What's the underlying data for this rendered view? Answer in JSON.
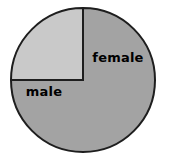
{
  "chart_data": {
    "type": "pie",
    "title": "",
    "subtitle": "",
    "xlabel": "",
    "ylabel": "",
    "legend": "none",
    "labels_position": "inside-slice",
    "grid": false,
    "categories": [
      "male",
      "female"
    ],
    "values": [
      75,
      25
    ],
    "value_unit": "percent",
    "slices": [
      {
        "label": "male",
        "value": 75,
        "color": "#a3a3a3",
        "start_angle_deg": 90,
        "end_angle_deg": 360,
        "label_x": 44,
        "label_y": 96
      },
      {
        "label": "female",
        "value": 25,
        "color": "#c9c9c9",
        "start_angle_deg": 0,
        "end_angle_deg": 90,
        "label_x": 118,
        "label_y": 62
      }
    ],
    "geometry": {
      "center_x": 83,
      "center_y": 80,
      "radius": 72
    },
    "style": {
      "background": "#ffffff",
      "outline_color": "#1e1e1e",
      "outline_width": 2,
      "label_color": "#000000"
    }
  }
}
